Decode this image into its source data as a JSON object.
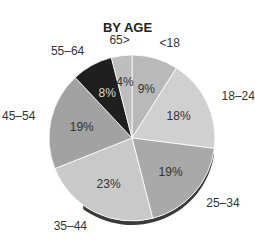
{
  "chart_data": {
    "type": "pie",
    "title": "BY AGE",
    "categories": [
      "<18",
      "18–24",
      "25–34",
      "35–44",
      "45–54",
      "55–64",
      "65>"
    ],
    "values": [
      9,
      18,
      19,
      23,
      19,
      8,
      4
    ],
    "value_labels": [
      "9%",
      "18%",
      "19%",
      "23%",
      "19%",
      "8%",
      "4%"
    ],
    "colors": [
      "#b9b9b9",
      "#d0d0d0",
      "#a9a9a9",
      "#c9c9c9",
      "#a2a2a2",
      "#1f1f1f",
      "#bebebe"
    ],
    "start_angle": "12 o'clock",
    "direction": "clockwise",
    "legend": "none (labels outside slices)"
  }
}
